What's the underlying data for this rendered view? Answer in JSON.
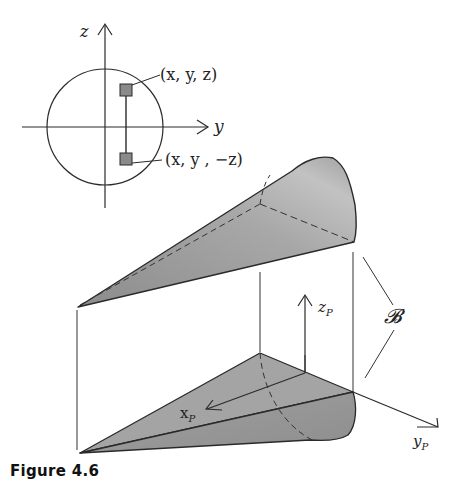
{
  "figure": {
    "caption": "Figure 4.6",
    "inset": {
      "axis_z_label": "z",
      "axis_y_label": "y",
      "point_upper_label": "(x, y, z)",
      "point_lower_label": "(x, y , −z)"
    },
    "main": {
      "region_label": "𝓑",
      "axis_zp_label": "z",
      "axis_zp_sub": "P",
      "axis_xp_label": "x",
      "axis_xp_sub": "P",
      "axis_yp_label": "y",
      "axis_yp_sub": "P"
    },
    "colors": {
      "line": "#2a2a2a",
      "solid_fill": "#9a9a9a",
      "solid_light": "#c4c4c4",
      "marker_fill": "#8a8a8a"
    }
  }
}
